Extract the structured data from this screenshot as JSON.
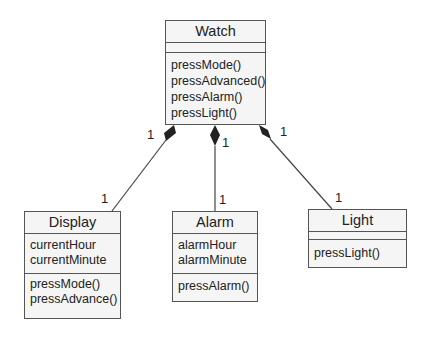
{
  "diagram": {
    "type": "UML class diagram",
    "classes": [
      {
        "id": "watch",
        "name": "Watch",
        "attributes": [],
        "operations": [
          "pressMode()",
          "pressAdvanced()",
          "pressAlarm()",
          "pressLight()"
        ]
      },
      {
        "id": "display",
        "name": "Display",
        "attributes": [
          "currentHour",
          "currentMinute"
        ],
        "operations": [
          "pressMode()",
          "pressAdvance()"
        ]
      },
      {
        "id": "alarm",
        "name": "Alarm",
        "attributes": [
          "alarmHour",
          "alarmMinute"
        ],
        "operations": [
          "pressAlarm()"
        ]
      },
      {
        "id": "light",
        "name": "Light",
        "attributes": [],
        "operations": [
          "pressLight()"
        ]
      }
    ],
    "relationships": [
      {
        "type": "composition",
        "whole": "Watch",
        "part": "Display",
        "whole_multiplicity": "1",
        "part_multiplicity": "1"
      },
      {
        "type": "composition",
        "whole": "Watch",
        "part": "Alarm",
        "whole_multiplicity": "1",
        "part_multiplicity": "1"
      },
      {
        "type": "composition",
        "whole": "Watch",
        "part": "Light",
        "whole_multiplicity": "1",
        "part_multiplicity": "1"
      }
    ],
    "colors": {
      "box_fill": "#f5f5f5",
      "stroke": "#555555",
      "background": "#ffffff"
    }
  }
}
